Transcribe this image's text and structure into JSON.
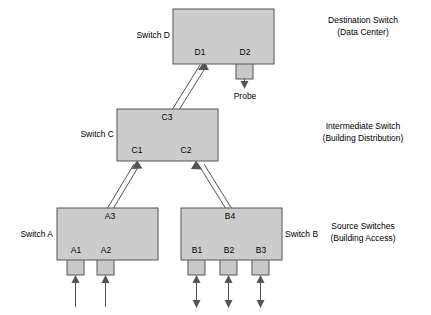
{
  "diagram": {
    "colors": {
      "box_fill": "#cccccc",
      "box_stroke": "#555555",
      "port_fill": "#c8c8c8",
      "port_stroke": "#555555",
      "line": "#555555",
      "text": "#000000",
      "background": "#ffffff"
    },
    "switches": [
      {
        "id": "D",
        "label": "Switch D",
        "ports": [
          "D1",
          "D2"
        ]
      },
      {
        "id": "C",
        "label": "Switch C",
        "ports": [
          "C3",
          "C1",
          "C2"
        ]
      },
      {
        "id": "A",
        "label": "Switch A",
        "ports": [
          "A3",
          "A1",
          "A2"
        ]
      },
      {
        "id": "B",
        "label": "Switch B",
        "ports": [
          "B4",
          "B1",
          "B2",
          "B3"
        ]
      }
    ],
    "port_labels": {
      "d1": "D1",
      "d2": "D2",
      "c3": "C3",
      "c1": "C1",
      "c2": "C2",
      "a3": "A3",
      "a1": "A1",
      "a2": "A2",
      "b4": "B4",
      "b1": "B1",
      "b2": "B2",
      "b3": "B3"
    },
    "switch_labels": {
      "d": "Switch D",
      "c": "Switch C",
      "a": "Switch A",
      "b": "Switch B"
    },
    "annotations": {
      "probe": "Probe"
    },
    "tiers": [
      {
        "line1": "Destination Switch",
        "line2": "(Data Center)"
      },
      {
        "line1": "Intermediate Switch",
        "line2": "(Building Distribution)"
      },
      {
        "line1": "Source Switches",
        "line2": "(Building Access)"
      }
    ]
  }
}
